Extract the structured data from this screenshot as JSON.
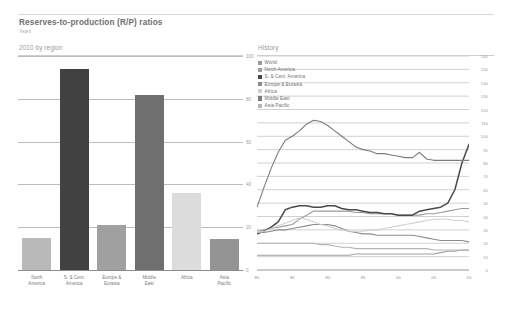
{
  "header": {
    "title": "Reserves-to-production (R/P) ratios",
    "subtitle": "Years"
  },
  "panels": {
    "left_heading": "2010 by region",
    "right_heading": "History"
  },
  "legend": {
    "items": [
      {
        "label": "World",
        "color": "#9a9a9a"
      },
      {
        "label": "North America",
        "color": "#9f9f9f"
      },
      {
        "label": "S. & Cent. America",
        "color": "#4a4a4a"
      },
      {
        "label": "Europe & Eurasia",
        "color": "#8c8c8c"
      },
      {
        "label": "Africa",
        "color": "#cfcfcf"
      },
      {
        "label": "Middle East",
        "color": "#7b7b7b"
      },
      {
        "label": "Asia Pacific",
        "color": "#b4b4b4"
      }
    ]
  },
  "chart_data": [
    {
      "type": "bar",
      "title": "2010 by region",
      "xlabel": "",
      "ylabel": "Years",
      "ylim": [
        0,
        100
      ],
      "yticks": [
        0,
        20,
        40,
        60,
        80,
        100
      ],
      "grid": true,
      "categories": [
        "North\nAmerica",
        "S. & Cent.\nAmerica",
        "Europe &\nEurasia",
        "Middle\nEast",
        "Africa",
        "Asia\nPacific"
      ],
      "values": [
        15,
        94,
        21,
        82,
        36,
        14.5
      ],
      "colors": [
        "#b9b9b9",
        "#414141",
        "#a0a0a0",
        "#6f6f6f",
        "#dcdcdc",
        "#949494"
      ]
    },
    {
      "type": "line",
      "title": "History",
      "xlabel": "",
      "ylabel": "Years",
      "ylim": [
        0,
        160
      ],
      "yticks": [
        0,
        10,
        20,
        30,
        40,
        50,
        60,
        70,
        80,
        90,
        100,
        110,
        120,
        130,
        140,
        150,
        160
      ],
      "xticks": [
        "80",
        "85",
        "90",
        "95",
        "00",
        "05",
        "10"
      ],
      "x": [
        1980,
        1981,
        1982,
        1983,
        1984,
        1985,
        1986,
        1987,
        1988,
        1989,
        1990,
        1991,
        1992,
        1993,
        1994,
        1995,
        1996,
        1997,
        1998,
        1999,
        2000,
        2001,
        2002,
        2003,
        2004,
        2005,
        2006,
        2007,
        2008,
        2009,
        2010
      ],
      "xlim": [
        1980,
        2010
      ],
      "grid": true,
      "legend_position": "top-left",
      "series": [
        {
          "name": "World",
          "color": "#9a9a9a",
          "values": [
            29,
            30,
            31,
            32,
            33,
            34,
            38,
            41,
            44,
            44,
            44,
            44,
            44,
            44,
            43,
            43,
            42,
            42,
            42,
            42,
            41,
            41,
            41,
            41,
            42,
            42,
            43,
            44,
            45,
            46,
            46
          ]
        },
        {
          "name": "North America",
          "color": "#9f9f9f",
          "values": [
            11,
            11,
            11,
            11,
            11,
            11,
            11,
            11,
            11,
            11,
            11,
            11,
            11,
            11,
            12,
            12,
            12,
            12,
            12,
            12,
            12,
            12,
            12,
            12,
            12,
            12,
            13,
            14,
            14,
            15,
            15
          ]
        },
        {
          "name": "S. & Cent. America",
          "color": "#4a4a4a",
          "values": [
            27,
            29,
            32,
            36,
            45,
            47,
            48,
            48,
            47,
            47,
            48,
            48,
            46,
            45,
            45,
            44,
            43,
            43,
            42,
            42,
            41,
            41,
            41,
            44,
            45,
            46,
            47,
            50,
            60,
            80,
            94
          ]
        },
        {
          "name": "Europe & Eurasia",
          "color": "#8c8c8c",
          "values": [
            28,
            28,
            29,
            30,
            30,
            31,
            32,
            33,
            34,
            34,
            34,
            33,
            31,
            29,
            28,
            27,
            27,
            26,
            26,
            26,
            26,
            26,
            26,
            25,
            24,
            23,
            22,
            22,
            22,
            22,
            21
          ]
        },
        {
          "name": "Africa",
          "color": "#cfcfcf",
          "values": [
            28,
            29,
            31,
            33,
            35,
            37,
            39,
            38,
            36,
            34,
            33,
            31,
            30,
            29,
            29,
            29,
            30,
            30,
            31,
            32,
            33,
            34,
            35,
            36,
            37,
            38,
            38,
            38,
            37,
            37,
            36
          ]
        },
        {
          "name": "Middle East",
          "color": "#7b7b7b",
          "values": [
            47,
            62,
            76,
            88,
            97,
            100,
            104,
            109,
            112,
            111,
            108,
            104,
            100,
            96,
            92,
            90,
            89,
            87,
            87,
            86,
            85,
            84,
            84,
            88,
            83,
            82,
            82,
            82,
            82,
            82,
            82
          ]
        },
        {
          "name": "Asia Pacific",
          "color": "#b4b4b4",
          "values": [
            20,
            20,
            20,
            20,
            20,
            20,
            20,
            20,
            20,
            19,
            19,
            18,
            17,
            17,
            16,
            16,
            16,
            16,
            16,
            16,
            16,
            16,
            16,
            16,
            16,
            15,
            15,
            15,
            15,
            15,
            14.5
          ]
        }
      ]
    }
  ]
}
